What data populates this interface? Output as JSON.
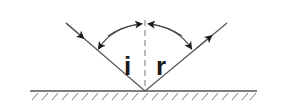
{
  "diagram": {
    "labels": {
      "incidence_angle": "i",
      "reflection_angle": "r"
    },
    "colors": {
      "line": "#555555",
      "ink": "#1a1a1a",
      "background": "#ffffff"
    },
    "elements": {
      "incident_ray": "incident ray with arrow toward mirror",
      "reflected_ray": "reflected ray with arrow away from mirror",
      "normal": "dashed normal line",
      "mirror": "hatched reflecting surface",
      "angle_arcs": "double-headed arcs marking angles i and r"
    }
  }
}
